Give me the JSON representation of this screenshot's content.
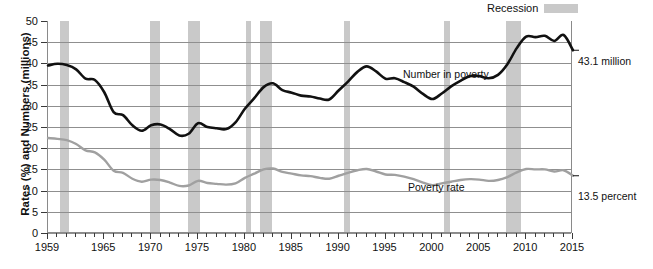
{
  "legend": {
    "label": "Recession",
    "swatch_color": "#c9c9c9"
  },
  "axes": {
    "ytitle": "Rates (%) and Numbers (millions)",
    "yticks": [
      0,
      5,
      10,
      15,
      20,
      25,
      30,
      35,
      40,
      45,
      50
    ],
    "xlabels": [
      1959,
      1965,
      1970,
      1975,
      1980,
      1985,
      1990,
      1995,
      2000,
      2005,
      2010,
      2015
    ]
  },
  "annotations": {
    "number_series": "Number in poverty",
    "rate_series": "Poverty rate",
    "number_end": "43.1 million",
    "rate_end": "13.5 percent"
  },
  "chart_data": {
    "type": "line",
    "title": "",
    "xlabel": "",
    "ylabel": "Rates (%) and Numbers (millions)",
    "xlim": [
      1959,
      2015
    ],
    "ylim": [
      0,
      50
    ],
    "grid": true,
    "legend_position": "top-right",
    "x": [
      1959,
      1960,
      1961,
      1962,
      1963,
      1964,
      1965,
      1966,
      1967,
      1968,
      1969,
      1970,
      1971,
      1972,
      1973,
      1974,
      1975,
      1976,
      1977,
      1978,
      1979,
      1980,
      1981,
      1982,
      1983,
      1984,
      1985,
      1986,
      1987,
      1988,
      1989,
      1990,
      1991,
      1992,
      1993,
      1994,
      1995,
      1996,
      1997,
      1998,
      1999,
      2000,
      2001,
      2002,
      2003,
      2004,
      2005,
      2006,
      2007,
      2008,
      2009,
      2010,
      2011,
      2012,
      2013,
      2014,
      2015
    ],
    "series": [
      {
        "name": "Number in poverty",
        "color": "#111111",
        "unit": "millions",
        "end_label": "43.1 million",
        "values": [
          39.5,
          39.9,
          39.6,
          38.6,
          36.4,
          36.1,
          33.2,
          28.5,
          27.8,
          25.4,
          24.1,
          25.4,
          25.6,
          24.5,
          23.0,
          23.4,
          25.9,
          25.0,
          24.7,
          24.5,
          26.1,
          29.3,
          31.8,
          34.4,
          35.3,
          33.7,
          33.1,
          32.4,
          32.2,
          31.7,
          31.5,
          33.6,
          35.7,
          38.0,
          39.3,
          38.1,
          36.4,
          36.5,
          35.6,
          34.5,
          32.8,
          31.6,
          32.9,
          34.6,
          35.9,
          37.0,
          37.0,
          36.5,
          37.3,
          39.8,
          43.6,
          46.3,
          46.2,
          46.5,
          45.3,
          46.7,
          43.1
        ]
      },
      {
        "name": "Poverty rate",
        "color": "#a0a0a0",
        "unit": "percent",
        "end_label": "13.5 percent",
        "values": [
          22.4,
          22.2,
          21.9,
          21.0,
          19.5,
          19.0,
          17.3,
          14.7,
          14.2,
          12.8,
          12.1,
          12.6,
          12.5,
          11.9,
          11.1,
          11.2,
          12.3,
          11.8,
          11.6,
          11.4,
          11.7,
          13.0,
          14.0,
          15.0,
          15.2,
          14.4,
          14.0,
          13.6,
          13.4,
          13.0,
          12.8,
          13.5,
          14.2,
          14.8,
          15.1,
          14.5,
          13.8,
          13.7,
          13.3,
          12.7,
          11.9,
          11.3,
          11.7,
          12.1,
          12.5,
          12.7,
          12.6,
          12.3,
          12.5,
          13.2,
          14.3,
          15.1,
          15.0,
          15.0,
          14.5,
          14.8,
          13.5
        ]
      }
    ],
    "recessions": [
      {
        "start": 1960.3,
        "end": 1961.2
      },
      {
        "start": 1969.9,
        "end": 1970.9
      },
      {
        "start": 1973.9,
        "end": 1975.2
      },
      {
        "start": 1980.1,
        "end": 1980.6
      },
      {
        "start": 1981.6,
        "end": 1982.9
      },
      {
        "start": 1990.6,
        "end": 1991.2
      },
      {
        "start": 2001.2,
        "end": 2001.9
      },
      {
        "start": 2007.9,
        "end": 2009.5
      }
    ]
  }
}
